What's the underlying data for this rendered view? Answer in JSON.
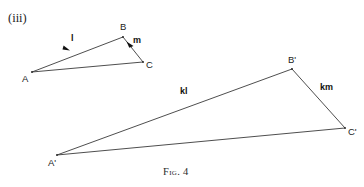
{
  "figure": {
    "part_label": "(iii)",
    "caption_prefix": "Fig.",
    "caption_number": "4",
    "background_color": "#ffffff",
    "stroke_color": "#3a3a3a",
    "text_color": "#1e1e1e"
  },
  "small_triangle": {
    "name": "triangle-abc",
    "vertices": [
      {
        "id": "A",
        "label": "A",
        "x": 32,
        "y": 72
      },
      {
        "id": "B",
        "label": "B",
        "x": 123,
        "y": 37
      },
      {
        "id": "C",
        "label": "C",
        "x": 143,
        "y": 62
      }
    ],
    "edges": [
      {
        "id": "AB",
        "from": "A",
        "to": "B",
        "vector_label": "l",
        "has_arrow": true
      },
      {
        "id": "BC",
        "from": "B",
        "to": "C",
        "vector_label": "m",
        "has_arrow": true
      },
      {
        "id": "AC",
        "from": "A",
        "to": "C",
        "vector_label": "",
        "has_arrow": false
      }
    ],
    "vector_l": {
      "scalar": "",
      "symbol": "l",
      "x": 73,
      "y": 37
    },
    "vector_m": {
      "scalar": "",
      "symbol": "m",
      "x": 134,
      "y": 38
    }
  },
  "large_triangle": {
    "name": "triangle-a-prime-b-prime-c-prime",
    "vertices": [
      {
        "id": "A'",
        "label": "A'",
        "x": 57,
        "y": 155
      },
      {
        "id": "B'",
        "label": "B'",
        "x": 292,
        "y": 69
      },
      {
        "id": "C'",
        "label": "C'",
        "x": 345,
        "y": 128
      }
    ],
    "edges": [
      {
        "id": "A'B'",
        "from": "A'",
        "to": "B'",
        "vector_label": "kl",
        "has_arrow": false
      },
      {
        "id": "B'C'",
        "from": "B'",
        "to": "C'",
        "vector_label": "km",
        "has_arrow": false
      },
      {
        "id": "A'C'",
        "from": "A'",
        "to": "C'",
        "vector_label": "",
        "has_arrow": false
      }
    ],
    "vector_kl": {
      "scalar": "k",
      "symbol": "l",
      "x": 183,
      "y": 90
    },
    "vector_km": {
      "scalar": "k",
      "symbol": "m",
      "x": 323,
      "y": 86
    }
  }
}
